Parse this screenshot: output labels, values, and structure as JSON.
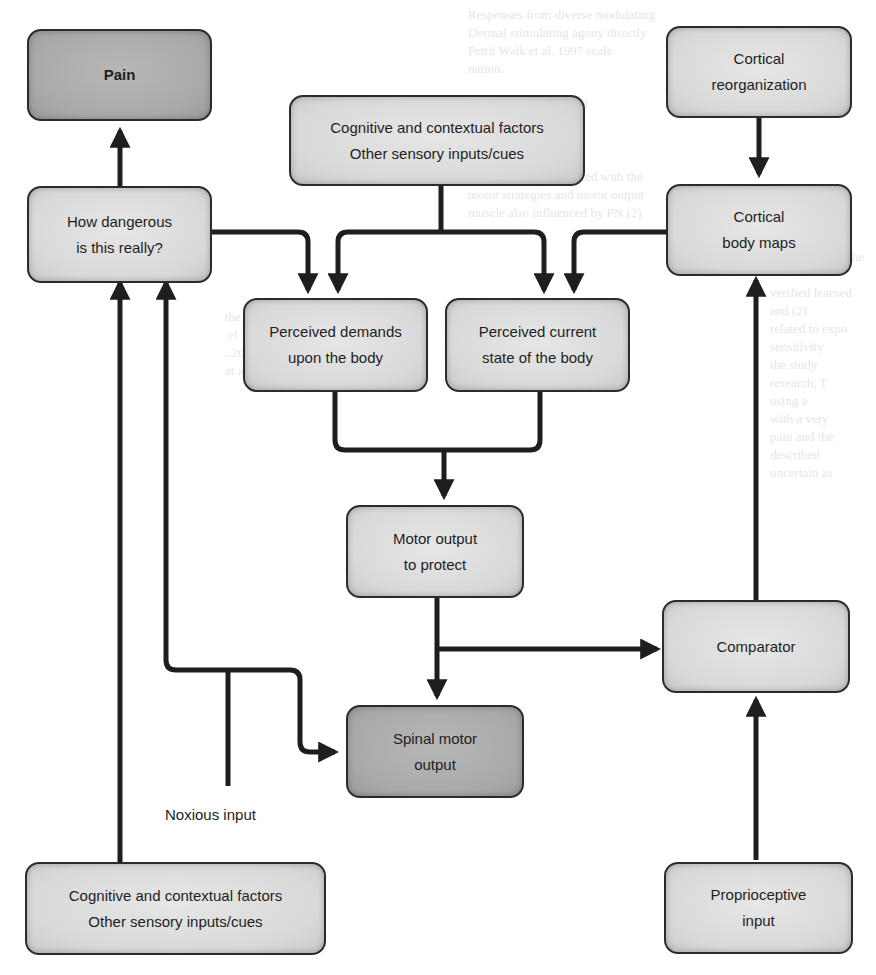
{
  "diagram": {
    "colors": {
      "node_fill": "#d9d9d9",
      "node_fill_dark": "#a9a9a9",
      "stroke": "#1e1e1e",
      "background": "#ffffff"
    },
    "nodes": {
      "pain": {
        "lines": [
          "Pain"
        ]
      },
      "danger": {
        "lines": [
          "How dangerous",
          "is this really?"
        ]
      },
      "context_top": {
        "lines": [
          "Cognitive and contextual factors",
          "Other sensory inputs/cues"
        ]
      },
      "cortical_reorg": {
        "lines": [
          "Cortical",
          "reorganization"
        ]
      },
      "body_maps": {
        "lines": [
          "Cortical",
          "body maps"
        ]
      },
      "demands": {
        "lines": [
          "Perceived demands",
          "upon the body"
        ]
      },
      "state": {
        "lines": [
          "Perceived current",
          "state of the body"
        ]
      },
      "motor_protect": {
        "lines": [
          "Motor output",
          "to protect"
        ]
      },
      "comparator": {
        "lines": [
          "Comparator"
        ]
      },
      "spinal": {
        "lines": [
          "Spinal motor",
          "output"
        ]
      },
      "context_bottom": {
        "lines": [
          "Cognitive and contextual factors",
          "Other sensory inputs/cues"
        ]
      },
      "proprio": {
        "lines": [
          "Proprioceptive",
          "input"
        ]
      }
    },
    "labels": {
      "noxious": "Noxious input"
    },
    "edges": [
      {
        "from": "danger",
        "to": "pain"
      },
      {
        "from": "danger",
        "to": "demands"
      },
      {
        "from": "context_top",
        "to": "demands"
      },
      {
        "from": "context_top",
        "to": "state"
      },
      {
        "from": "body_maps",
        "to": "state"
      },
      {
        "from": "cortical_reorg",
        "to": "body_maps"
      },
      {
        "from": "demands",
        "to": "motor_protect"
      },
      {
        "from": "state",
        "to": "motor_protect"
      },
      {
        "from": "motor_protect",
        "to": "spinal"
      },
      {
        "from": "motor_protect",
        "to": "comparator"
      },
      {
        "from": "comparator",
        "to": "body_maps"
      },
      {
        "from": "proprio",
        "to": "comparator"
      },
      {
        "from": "context_bottom",
        "to": "danger"
      },
      {
        "from": "noxious",
        "to": "danger"
      },
      {
        "from": "noxious",
        "to": "spinal"
      }
    ]
  }
}
